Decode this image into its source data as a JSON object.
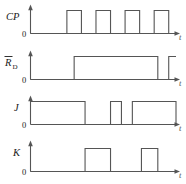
{
  "figure": {
    "kind": "timing-waveform-diagram",
    "line_color": "#555555",
    "text_color": "#1a1a1a",
    "background": "#ffffff",
    "baseline_label": "0",
    "time_axis_label": "t"
  },
  "chart_data": {
    "type": "line",
    "xlabel": "t",
    "ylabel": "",
    "grid": false,
    "legend": false,
    "xlim": [
      0,
      160
    ],
    "ylim": [
      0,
      1
    ],
    "note": "Digital timing waveforms; y values are logic levels 0 (low) and 1 (high). x is in pixel-time units along the shared time axis.",
    "series": [
      {
        "name": "CP",
        "label": "CP",
        "overbar": false,
        "subscript": "",
        "row": 1,
        "initial_level": 0,
        "transitions": [
          {
            "x": 40,
            "level": 1
          },
          {
            "x": 56,
            "level": 0
          },
          {
            "x": 72,
            "level": 1
          },
          {
            "x": 88,
            "level": 0
          },
          {
            "x": 104,
            "level": 1
          },
          {
            "x": 120,
            "level": 0
          },
          {
            "x": 136,
            "level": 1
          },
          {
            "x": 152,
            "level": 0
          }
        ],
        "pulse_count": 4,
        "description": "Clock: four equal-width positive pulses, 50% duty, period 32"
      },
      {
        "name": "RD",
        "label": "R",
        "overbar": true,
        "subscript": "D",
        "row": 2,
        "initial_level": 0,
        "transitions": [
          {
            "x": 48,
            "level": 1
          },
          {
            "x": 140,
            "level": 0
          },
          {
            "x": 152,
            "level": 1
          }
        ],
        "description": "Active-low direct reset: low at start, high through the middle, brief low notch near the end, then high"
      },
      {
        "name": "J",
        "label": "J",
        "overbar": false,
        "subscript": "",
        "row": 3,
        "initial_level": 1,
        "transitions": [
          {
            "x": 60,
            "level": 0
          },
          {
            "x": 88,
            "level": 1
          },
          {
            "x": 100,
            "level": 0
          },
          {
            "x": 112,
            "level": 1
          },
          {
            "x": 160,
            "level": 0
          }
        ],
        "description": "J input: high, low, short high pulse, long high, then low"
      },
      {
        "name": "K",
        "label": "K",
        "overbar": false,
        "subscript": "",
        "row": 4,
        "initial_level": 0,
        "transitions": [
          {
            "x": 60,
            "level": 1
          },
          {
            "x": 88,
            "level": 0
          },
          {
            "x": 122,
            "level": 1
          },
          {
            "x": 140,
            "level": 0
          }
        ],
        "description": "K input: low, one wide high pulse, low, one narrower high pulse, then low"
      }
    ]
  }
}
